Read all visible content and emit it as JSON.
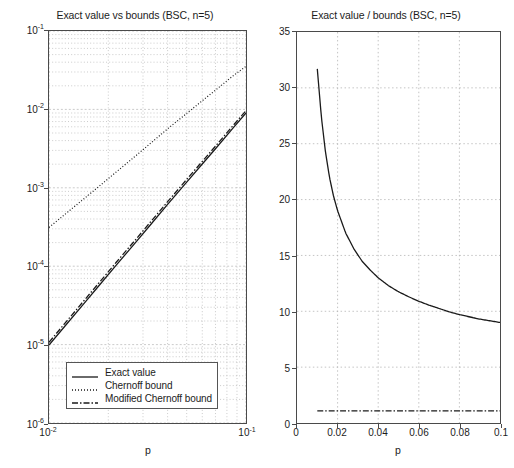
{
  "figure": {
    "width": 514,
    "height": 468,
    "background": "#ffffff",
    "line_color": "#1a1a1a",
    "grid_color": "#b4b4b4",
    "axis_color": "#4a4a4a"
  },
  "left_panel": {
    "title": "Exact value vs bounds (BSC, n=5)",
    "xlabel": "p",
    "x_ticks": [
      {
        "value": 0.01,
        "mantissa": "10",
        "exponent": "-2"
      },
      {
        "value": 0.1,
        "mantissa": "10",
        "exponent": "-1"
      }
    ],
    "y_ticks": [
      {
        "value": 0.1,
        "mantissa": "10",
        "exponent": "-1"
      },
      {
        "value": 0.01,
        "mantissa": "10",
        "exponent": "-2"
      },
      {
        "value": 0.001,
        "mantissa": "10",
        "exponent": "-3"
      },
      {
        "value": 0.0001,
        "mantissa": "10",
        "exponent": "-4"
      },
      {
        "value": 1e-05,
        "mantissa": "10",
        "exponent": "-5"
      },
      {
        "value": 1e-06,
        "mantissa": "10",
        "exponent": "-6"
      }
    ],
    "legend": [
      {
        "label": "Exact value",
        "style": "solid"
      },
      {
        "label": "Chernoff bound",
        "style": "dotted"
      },
      {
        "label": "Modified Chernoff bound",
        "style": "dashdot"
      }
    ]
  },
  "right_panel": {
    "title": "Exact value / bounds (BSC, n=5)",
    "xlabel": "p",
    "x_ticks": [
      "0",
      "0.02",
      "0.04",
      "0.06",
      "0.08",
      "0.1"
    ],
    "y_ticks": [
      "0",
      "5",
      "10",
      "15",
      "20",
      "25",
      "30",
      "35"
    ],
    "legend": [
      {
        "label": "Chernoff/Exact",
        "style": "solid"
      },
      {
        "label": "Mod.Chernoff/Exact",
        "style": "dashdot"
      }
    ]
  },
  "chart_data": [
    {
      "type": "line",
      "id": "left",
      "title": "Exact value vs bounds (BSC, n=5)",
      "xlabel": "p",
      "ylabel": "",
      "xscale": "log",
      "yscale": "log",
      "xlim": [
        0.01,
        0.1
      ],
      "ylim": [
        1e-06,
        0.1
      ],
      "grid": true,
      "legend_position": "lower right",
      "x": [
        0.01,
        0.012,
        0.015,
        0.018,
        0.022,
        0.027,
        0.033,
        0.04,
        0.05,
        0.06,
        0.07,
        0.085,
        0.1
      ],
      "series": [
        {
          "name": "Exact value",
          "style": "solid",
          "values": [
            9.85e-06,
            1.7e-05,
            3.31e-05,
            5.71e-05,
            0.000104,
            0.00019,
            0.000345,
            0.000614,
            0.00118,
            0.00201,
            0.00315,
            0.0056,
            0.009
          ]
        },
        {
          "name": "Modified Chernoff bound",
          "style": "dashdot",
          "values": [
            1.07e-05,
            1.85e-05,
            3.6e-05,
            6.2e-05,
            0.000113,
            0.000206,
            0.000375,
            0.000665,
            0.00128,
            0.00217,
            0.0034,
            0.00602,
            0.00965
          ]
        },
        {
          "name": "Chernoff bound",
          "style": "dotted",
          "values": [
            0.000312,
            0.000455,
            0.00072,
            0.00105,
            0.0016,
            0.00245,
            0.00375,
            0.00565,
            0.0089,
            0.0129,
            0.0176,
            0.0262,
            0.0355
          ]
        }
      ],
      "chernoff_right_end": 0.072
    },
    {
      "type": "line",
      "id": "right",
      "title": "Exact value / bounds (BSC, n=5)",
      "xlabel": "p",
      "ylabel": "",
      "xscale": "linear",
      "yscale": "linear",
      "xlim": [
        0,
        0.1
      ],
      "ylim": [
        0,
        35
      ],
      "grid": true,
      "legend_position": "upper right",
      "x": [
        0.01,
        0.012,
        0.014,
        0.016,
        0.018,
        0.02,
        0.024,
        0.028,
        0.032,
        0.036,
        0.04,
        0.045,
        0.05,
        0.055,
        0.06,
        0.065,
        0.07,
        0.075,
        0.08,
        0.085,
        0.09,
        0.095,
        0.1
      ],
      "series": [
        {
          "name": "Chernoff/Exact",
          "style": "solid",
          "values": [
            31.7,
            27.4,
            24.3,
            22.0,
            20.3,
            19.0,
            17.0,
            15.6,
            14.5,
            13.7,
            13.0,
            12.3,
            11.75,
            11.3,
            10.9,
            10.55,
            10.25,
            9.95,
            9.7,
            9.5,
            9.3,
            9.15,
            9.0
          ]
        },
        {
          "name": "Mod.Chernoff/Exact",
          "style": "dashdot",
          "values": [
            1.08,
            1.08,
            1.08,
            1.08,
            1.08,
            1.08,
            1.08,
            1.08,
            1.08,
            1.08,
            1.08,
            1.08,
            1.08,
            1.08,
            1.08,
            1.08,
            1.08,
            1.08,
            1.08,
            1.08,
            1.08,
            1.08,
            1.08
          ]
        }
      ]
    }
  ]
}
